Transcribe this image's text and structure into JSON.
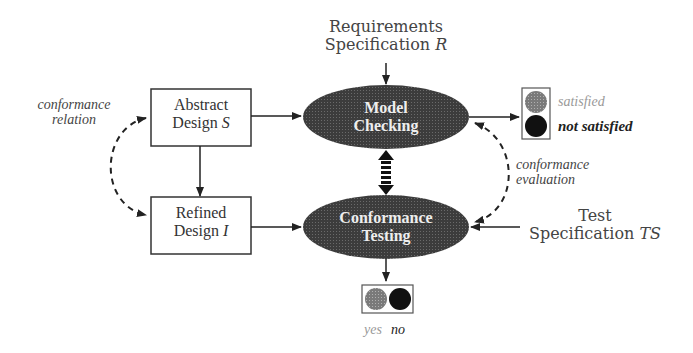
{
  "diagram": {
    "nodes": {
      "abstract_design": {
        "line1": "Abstract",
        "line2": "Design",
        "var": "S"
      },
      "refined_design": {
        "line1": "Refined",
        "line2": "Design",
        "var": "I"
      },
      "model_checking": {
        "line1": "Model",
        "line2": "Checking"
      },
      "conformance_testing": {
        "line1": "Conformance",
        "line2": "Testing"
      },
      "requirements_spec": {
        "line1": "Requirements",
        "line2": "Specification",
        "var": "R"
      },
      "test_spec": {
        "line1": "Test",
        "line2": "Specification",
        "var": "TS"
      }
    },
    "annotations": {
      "conformance_relation": {
        "line1": "conformance",
        "line2": "relation"
      },
      "conformance_evaluation": {
        "line1": "conformance",
        "line2": "evaluation"
      }
    },
    "outcomes": {
      "model_checking": {
        "satisfied": "satisfied",
        "not_satisfied": "not satisfied"
      },
      "conformance_testing": {
        "yes": "yes",
        "no": "no"
      }
    },
    "colors": {
      "ellipse_fill": "#4a4a4a",
      "stroke": "#222222",
      "light_circle": "#8a8a8a",
      "dark_circle": "#111111"
    }
  }
}
